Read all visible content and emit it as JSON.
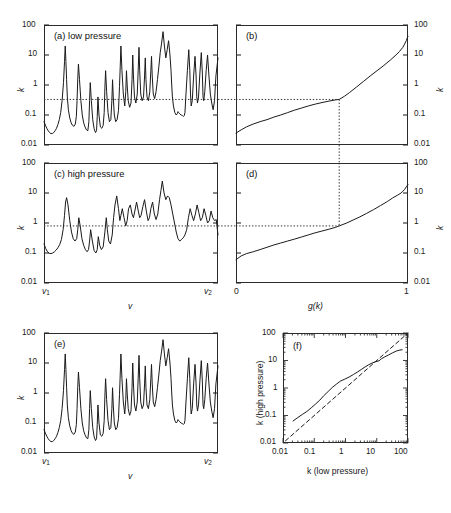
{
  "figure": {
    "caption_tags": [
      "(a) low pressure",
      "(b)",
      "(c) high pressure",
      "(d)",
      "(e)",
      "(f)"
    ],
    "decade_labels": [
      "100",
      "10",
      "1",
      "0.1",
      "0.01"
    ],
    "k_axis_label": "k",
    "nu_axis_label": "v",
    "nu_start_label": "v",
    "nu_start_sub": "1",
    "nu_end_label": "v",
    "nu_end_sub": "2",
    "g_axis_label": "g(k)",
    "g_min_label": "0",
    "g_max_label": "1",
    "f_xlabel": "k (low pressure)",
    "f_ylabel": "k (high pressure)",
    "f_tick_labels": [
      "0.01",
      "0.1",
      "1",
      "10",
      "100"
    ],
    "line_color": "#1a1a1a",
    "frame_color": "#2b2b2b",
    "dotted_color": "#333333"
  },
  "chart_data": [
    {
      "type": "line",
      "id": "a",
      "title": "(a) low pressure",
      "xlabel": "v",
      "ylabel": "k",
      "ylim": [
        0.01,
        100
      ],
      "yscale": "log",
      "xlim": [
        0,
        1
      ],
      "grid": false,
      "annotation_line": {
        "type": "horizontal",
        "y": 0.33,
        "style": "dotted"
      },
      "description": "Narrow-line absorption spectrum at low pressure, many sharp spikes from 0.02 to 60",
      "x": [
        0.0,
        0.008,
        0.016,
        0.024,
        0.032,
        0.04,
        0.048,
        0.056,
        0.064,
        0.072,
        0.08,
        0.088,
        0.096,
        0.104,
        0.112,
        0.118,
        0.122,
        0.126,
        0.13,
        0.134,
        0.14,
        0.148,
        0.156,
        0.164,
        0.172,
        0.18,
        0.186,
        0.19,
        0.194,
        0.198,
        0.204,
        0.212,
        0.22,
        0.228,
        0.236,
        0.244,
        0.252,
        0.258,
        0.262,
        0.266,
        0.272,
        0.28,
        0.288,
        0.296,
        0.302,
        0.306,
        0.31,
        0.316,
        0.324,
        0.332,
        0.34,
        0.346,
        0.35,
        0.354,
        0.36,
        0.368,
        0.376,
        0.384,
        0.39,
        0.394,
        0.398,
        0.404,
        0.412,
        0.42,
        0.428,
        0.434,
        0.438,
        0.442,
        0.448,
        0.456,
        0.464,
        0.47,
        0.474,
        0.478,
        0.484,
        0.492,
        0.5,
        0.506,
        0.51,
        0.514,
        0.52,
        0.528,
        0.536,
        0.542,
        0.546,
        0.55,
        0.556,
        0.564,
        0.572,
        0.578,
        0.582,
        0.586,
        0.592,
        0.6,
        0.608,
        0.614,
        0.618,
        0.622,
        0.628,
        0.636,
        0.644,
        0.652,
        0.66,
        0.668,
        0.676,
        0.684,
        0.692,
        0.7,
        0.708,
        0.716,
        0.724,
        0.73,
        0.734,
        0.738,
        0.744,
        0.752,
        0.76,
        0.766,
        0.77,
        0.774,
        0.78,
        0.788,
        0.796,
        0.802,
        0.806,
        0.81,
        0.816,
        0.824,
        0.832,
        0.838,
        0.842,
        0.846,
        0.852,
        0.86,
        0.868,
        0.874,
        0.878,
        0.882,
        0.888,
        0.896,
        0.904,
        0.91,
        0.914,
        0.918,
        0.924,
        0.932,
        0.94,
        0.948,
        0.956,
        0.964,
        0.972,
        0.98,
        0.988,
        1.0
      ],
      "y": [
        0.06,
        0.046,
        0.036,
        0.03,
        0.026,
        0.024,
        0.024,
        0.026,
        0.03,
        0.036,
        0.048,
        0.07,
        0.12,
        0.3,
        1.2,
        6.0,
        20.0,
        6.0,
        1.5,
        0.4,
        0.15,
        0.08,
        0.055,
        0.045,
        0.042,
        0.05,
        0.09,
        0.3,
        1.6,
        5.0,
        1.5,
        0.3,
        0.1,
        0.055,
        0.04,
        0.032,
        0.03,
        0.06,
        0.3,
        1.2,
        0.3,
        0.07,
        0.035,
        0.026,
        0.03,
        0.09,
        0.4,
        0.1,
        0.04,
        0.036,
        0.045,
        0.12,
        0.8,
        3.0,
        0.6,
        0.12,
        0.06,
        0.07,
        0.3,
        1.5,
        0.4,
        0.1,
        0.06,
        0.07,
        0.14,
        0.9,
        4.0,
        20.0,
        3.0,
        0.5,
        0.2,
        0.6,
        3.0,
        1.0,
        0.3,
        0.18,
        0.25,
        1.5,
        10.0,
        2.0,
        0.4,
        0.25,
        0.5,
        4.0,
        18.0,
        3.0,
        0.5,
        0.3,
        0.4,
        2.0,
        8.0,
        1.5,
        0.4,
        0.3,
        0.6,
        3.0,
        9.0,
        2.0,
        0.5,
        0.35,
        0.6,
        1.5,
        4.0,
        12.0,
        25.0,
        60.0,
        20.0,
        8.0,
        15.0,
        30.0,
        10.0,
        3.0,
        1.0,
        0.4,
        0.2,
        0.12,
        0.1,
        0.11,
        0.13,
        0.12,
        0.11,
        0.1,
        0.095,
        0.09,
        0.095,
        0.12,
        0.5,
        3.0,
        15.0,
        3.0,
        0.5,
        0.2,
        0.3,
        2.0,
        9.0,
        2.0,
        0.4,
        0.25,
        0.4,
        2.5,
        12.0,
        2.5,
        0.4,
        0.3,
        0.6,
        3.0,
        10.0,
        2.0,
        0.5,
        0.25,
        0.15,
        0.3,
        2.0,
        8.0,
        1.0,
        0.1
      ]
    },
    {
      "type": "line",
      "id": "b",
      "title": "(b)",
      "xlabel": "g(k)",
      "ylabel": "k",
      "ylim": [
        0.01,
        100
      ],
      "yscale": "log",
      "xlim": [
        0,
        1
      ],
      "grid": false,
      "annotation_line": {
        "type": "crosshair",
        "g": 0.6,
        "k": 0.33,
        "style": "dotted"
      },
      "description": "Cumulative distribution (reordered k) for low pressure; monotonic rise from 0.025 to 40",
      "x": [
        0.0,
        0.03,
        0.06,
        0.1,
        0.14,
        0.18,
        0.22,
        0.26,
        0.3,
        0.34,
        0.38,
        0.42,
        0.46,
        0.5,
        0.54,
        0.58,
        0.6,
        0.63,
        0.66,
        0.7,
        0.74,
        0.78,
        0.82,
        0.86,
        0.9,
        0.93,
        0.95,
        0.97,
        0.98,
        0.99,
        0.995,
        1.0
      ],
      "y": [
        0.025,
        0.032,
        0.04,
        0.05,
        0.06,
        0.07,
        0.085,
        0.1,
        0.12,
        0.145,
        0.17,
        0.2,
        0.23,
        0.26,
        0.29,
        0.32,
        0.33,
        0.42,
        0.56,
        0.85,
        1.3,
        2.0,
        3.0,
        4.5,
        7.0,
        10.0,
        13.0,
        18.0,
        23.0,
        30.0,
        36.0,
        42.0
      ]
    },
    {
      "type": "line",
      "id": "c",
      "title": "(c) high pressure",
      "xlabel": "v",
      "ylabel": "k",
      "ylim": [
        0.01,
        100
      ],
      "yscale": "log",
      "xlim": [
        0,
        1
      ],
      "grid": false,
      "annotation_line": {
        "type": "horizontal",
        "y": 0.8,
        "style": "dotted"
      },
      "description": "Pressure-broadened spectrum; same band structure as (a) but smoothed, peaks 0.08 to 25",
      "x": [
        0.0,
        0.01,
        0.02,
        0.03,
        0.04,
        0.05,
        0.06,
        0.07,
        0.08,
        0.09,
        0.1,
        0.11,
        0.118,
        0.124,
        0.13,
        0.138,
        0.148,
        0.158,
        0.168,
        0.178,
        0.188,
        0.194,
        0.2,
        0.208,
        0.218,
        0.228,
        0.238,
        0.248,
        0.256,
        0.262,
        0.268,
        0.278,
        0.288,
        0.298,
        0.306,
        0.312,
        0.32,
        0.33,
        0.34,
        0.35,
        0.358,
        0.364,
        0.372,
        0.382,
        0.392,
        0.4,
        0.408,
        0.418,
        0.428,
        0.436,
        0.442,
        0.45,
        0.46,
        0.47,
        0.478,
        0.486,
        0.496,
        0.506,
        0.514,
        0.522,
        0.532,
        0.542,
        0.55,
        0.558,
        0.568,
        0.578,
        0.588,
        0.598,
        0.606,
        0.614,
        0.624,
        0.634,
        0.644,
        0.654,
        0.664,
        0.672,
        0.68,
        0.69,
        0.7,
        0.71,
        0.72,
        0.73,
        0.74,
        0.75,
        0.76,
        0.77,
        0.78,
        0.79,
        0.8,
        0.81,
        0.82,
        0.83,
        0.84,
        0.85,
        0.86,
        0.87,
        0.88,
        0.89,
        0.9,
        0.91,
        0.92,
        0.93,
        0.94,
        0.95,
        0.96,
        0.97,
        0.98,
        0.99,
        1.0
      ],
      "y": [
        0.2,
        0.14,
        0.11,
        0.098,
        0.095,
        0.1,
        0.11,
        0.125,
        0.15,
        0.19,
        0.28,
        0.6,
        1.8,
        5.0,
        7.0,
        4.0,
        1.2,
        0.5,
        0.3,
        0.25,
        0.3,
        0.6,
        1.5,
        0.8,
        0.3,
        0.18,
        0.13,
        0.11,
        0.13,
        0.25,
        0.6,
        0.25,
        0.12,
        0.1,
        0.13,
        0.35,
        0.18,
        0.13,
        0.16,
        0.5,
        1.5,
        0.6,
        0.25,
        0.2,
        0.4,
        1.5,
        4.0,
        8.0,
        3.0,
        1.2,
        1.8,
        3.0,
        1.5,
        0.8,
        1.2,
        3.0,
        4.0,
        2.0,
        1.5,
        2.5,
        5.0,
        2.5,
        1.5,
        1.8,
        3.5,
        6.0,
        2.5,
        1.2,
        1.5,
        3.0,
        5.0,
        2.0,
        1.3,
        2.0,
        6.0,
        12.0,
        25.0,
        10.0,
        6.0,
        8.0,
        7.0,
        4.0,
        2.0,
        1.0,
        0.5,
        0.3,
        0.25,
        0.28,
        0.32,
        0.4,
        0.6,
        1.5,
        3.0,
        1.8,
        1.2,
        2.0,
        4.0,
        2.2,
        1.2,
        1.5,
        3.0,
        1.8,
        1.0,
        1.2,
        2.5,
        1.5,
        1.2,
        1.3,
        0.4
      ]
    },
    {
      "type": "line",
      "id": "d",
      "title": "(d)",
      "xlabel": "g(k)",
      "ylabel": "k",
      "ylim": [
        0.01,
        100
      ],
      "yscale": "log",
      "xlim": [
        0,
        1
      ],
      "grid": false,
      "annotation_line": {
        "type": "crosshair",
        "g": 0.6,
        "k": 0.8,
        "style": "dotted"
      },
      "description": "Cumulative distribution for high pressure; rises from 0.06 to about 18",
      "x": [
        0.0,
        0.03,
        0.06,
        0.1,
        0.14,
        0.18,
        0.22,
        0.26,
        0.3,
        0.34,
        0.38,
        0.42,
        0.46,
        0.5,
        0.54,
        0.58,
        0.6,
        0.64,
        0.68,
        0.72,
        0.76,
        0.8,
        0.84,
        0.88,
        0.91,
        0.94,
        0.96,
        0.97,
        0.98,
        0.99,
        0.995,
        1.0
      ],
      "y": [
        0.06,
        0.08,
        0.095,
        0.11,
        0.13,
        0.155,
        0.185,
        0.215,
        0.25,
        0.29,
        0.34,
        0.4,
        0.47,
        0.54,
        0.62,
        0.72,
        0.8,
        0.98,
        1.25,
        1.6,
        2.1,
        2.8,
        3.8,
        5.2,
        6.8,
        8.5,
        10.0,
        11.5,
        13.0,
        16.0,
        17.5,
        19.0
      ]
    },
    {
      "type": "line",
      "id": "e",
      "title": "(e)",
      "xlabel": "v",
      "ylabel": "k",
      "ylim": [
        0.01,
        100
      ],
      "yscale": "log",
      "xlim": [
        0,
        1
      ],
      "grid": false,
      "annotation_line": null,
      "description": "Low pressure spectrum repeated for the mapping comparison",
      "x": [
        0.0,
        0.008,
        0.016,
        0.024,
        0.032,
        0.04,
        0.048,
        0.056,
        0.064,
        0.072,
        0.08,
        0.088,
        0.096,
        0.104,
        0.112,
        0.118,
        0.122,
        0.126,
        0.13,
        0.134,
        0.14,
        0.148,
        0.156,
        0.164,
        0.172,
        0.18,
        0.186,
        0.19,
        0.194,
        0.198,
        0.204,
        0.212,
        0.22,
        0.228,
        0.236,
        0.244,
        0.252,
        0.258,
        0.262,
        0.266,
        0.272,
        0.28,
        0.288,
        0.296,
        0.302,
        0.306,
        0.31,
        0.316,
        0.324,
        0.332,
        0.34,
        0.346,
        0.35,
        0.354,
        0.36,
        0.368,
        0.376,
        0.384,
        0.39,
        0.394,
        0.398,
        0.404,
        0.412,
        0.42,
        0.428,
        0.434,
        0.438,
        0.442,
        0.448,
        0.456,
        0.464,
        0.47,
        0.474,
        0.478,
        0.484,
        0.492,
        0.5,
        0.506,
        0.51,
        0.514,
        0.52,
        0.528,
        0.536,
        0.542,
        0.546,
        0.55,
        0.556,
        0.564,
        0.572,
        0.578,
        0.582,
        0.586,
        0.592,
        0.6,
        0.608,
        0.614,
        0.618,
        0.622,
        0.628,
        0.636,
        0.644,
        0.652,
        0.66,
        0.668,
        0.676,
        0.684,
        0.692,
        0.7,
        0.708,
        0.716,
        0.724,
        0.73,
        0.734,
        0.738,
        0.744,
        0.752,
        0.76,
        0.766,
        0.77,
        0.774,
        0.78,
        0.788,
        0.796,
        0.802,
        0.806,
        0.81,
        0.816,
        0.824,
        0.832,
        0.838,
        0.842,
        0.846,
        0.852,
        0.86,
        0.868,
        0.874,
        0.878,
        0.882,
        0.888,
        0.896,
        0.904,
        0.91,
        0.914,
        0.918,
        0.924,
        0.932,
        0.94,
        0.948,
        0.956,
        0.964,
        0.972,
        0.98,
        0.988,
        1.0
      ],
      "y": [
        0.06,
        0.046,
        0.036,
        0.03,
        0.026,
        0.024,
        0.024,
        0.026,
        0.03,
        0.036,
        0.048,
        0.07,
        0.12,
        0.3,
        1.2,
        6.0,
        20.0,
        6.0,
        1.5,
        0.4,
        0.15,
        0.08,
        0.055,
        0.045,
        0.042,
        0.05,
        0.09,
        0.3,
        1.6,
        5.0,
        1.5,
        0.3,
        0.1,
        0.055,
        0.04,
        0.032,
        0.03,
        0.06,
        0.3,
        1.2,
        0.3,
        0.07,
        0.035,
        0.026,
        0.03,
        0.09,
        0.4,
        0.1,
        0.04,
        0.036,
        0.045,
        0.12,
        0.8,
        3.0,
        0.6,
        0.12,
        0.06,
        0.07,
        0.3,
        1.5,
        0.4,
        0.1,
        0.06,
        0.07,
        0.14,
        0.9,
        4.0,
        20.0,
        3.0,
        0.5,
        0.2,
        0.6,
        3.0,
        1.0,
        0.3,
        0.18,
        0.25,
        1.5,
        10.0,
        2.0,
        0.4,
        0.25,
        0.5,
        4.0,
        18.0,
        3.0,
        0.5,
        0.3,
        0.4,
        2.0,
        8.0,
        1.5,
        0.4,
        0.3,
        0.6,
        3.0,
        9.0,
        2.0,
        0.5,
        0.35,
        0.6,
        1.5,
        4.0,
        12.0,
        25.0,
        60.0,
        20.0,
        8.0,
        15.0,
        30.0,
        10.0,
        3.0,
        1.0,
        0.4,
        0.2,
        0.12,
        0.1,
        0.11,
        0.13,
        0.12,
        0.11,
        0.1,
        0.095,
        0.09,
        0.095,
        0.12,
        0.5,
        3.0,
        15.0,
        3.0,
        0.5,
        0.2,
        0.3,
        2.0,
        9.0,
        2.0,
        0.4,
        0.25,
        0.4,
        2.5,
        12.0,
        2.5,
        0.4,
        0.3,
        0.6,
        3.0,
        10.0,
        2.0,
        0.5,
        0.25,
        0.15,
        0.3,
        2.0,
        8.0,
        1.0,
        0.1
      ]
    },
    {
      "type": "line",
      "id": "f",
      "title": "(f)",
      "xlabel": "k (low pressure)",
      "ylabel": "k (high pressure)",
      "xlim": [
        0.01,
        100
      ],
      "ylim": [
        0.01,
        100
      ],
      "xscale": "log",
      "yscale": "log",
      "grid": false,
      "series": [
        {
          "name": "mapping",
          "style": "solid",
          "x": [
            0.021,
            0.03,
            0.042,
            0.058,
            0.08,
            0.11,
            0.15,
            0.2,
            0.28,
            0.38,
            0.52,
            0.7,
            0.95,
            1.3,
            1.8,
            2.4,
            3.2,
            4.2,
            5.5,
            7.0,
            9.0,
            12.0,
            14.0,
            18.0,
            24.0,
            32.0,
            42.0,
            55.0,
            65.0
          ],
          "y": [
            0.063,
            0.085,
            0.11,
            0.14,
            0.19,
            0.26,
            0.36,
            0.52,
            0.75,
            1.05,
            1.4,
            1.8,
            2.1,
            2.5,
            3.1,
            3.8,
            4.7,
            5.8,
            7.0,
            8.0,
            9.0,
            9.8,
            11.5,
            13.5,
            16.0,
            19.0,
            22.0,
            24.0,
            24.5
          ]
        },
        {
          "name": "one-to-one",
          "style": "dashed",
          "x": [
            0.012,
            100.0
          ],
          "y": [
            0.012,
            100.0
          ]
        }
      ]
    }
  ]
}
